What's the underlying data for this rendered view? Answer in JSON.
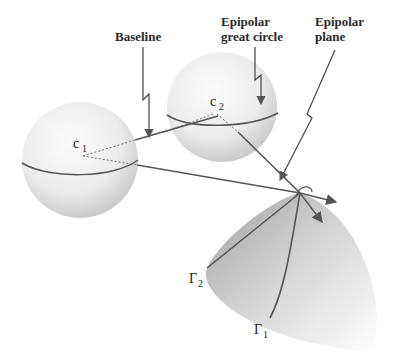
{
  "diagram": {
    "type": "epipolar-geometry-spherical",
    "labels": {
      "baseline": "Baseline",
      "epipolar_great_circle_line1": "Epipolar",
      "epipolar_great_circle_line2": "great circle",
      "epipolar_plane_line1": "Epipolar",
      "epipolar_plane_line2": "plane"
    },
    "nodes": {
      "c1": {
        "letter": "c",
        "sub": "1"
      },
      "c2": {
        "letter": "c",
        "sub": "2"
      },
      "gamma1": {
        "letter": "Γ",
        "sub": "1"
      },
      "gamma2": {
        "letter": "Γ",
        "sub": "2"
      }
    },
    "colors": {
      "line": "#555555",
      "text": "#2a2a2a",
      "sphere_light": "#f7f7f7",
      "sphere_dark": "#c8c8c8",
      "surface_dark": "#b0b0b0"
    }
  }
}
